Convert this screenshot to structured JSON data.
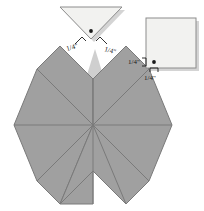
{
  "figure": {
    "background_color": "#ffffff",
    "colors": {
      "star_fill": "#a0a0a0",
      "star_stroke": "#7a7a7a",
      "piece_fill": "#f2f2f0",
      "piece_stroke": "#8c8c8c",
      "mark_color": "#1a1a1a",
      "shadow_color": "#c8c8c8"
    }
  },
  "star": {
    "name": "eight-pointed-star",
    "point_count": 8,
    "visible_diamond_count": 7,
    "missing_diamond": "top",
    "center": {
      "x": 93,
      "y": 125
    },
    "outer_radius": 79,
    "tips": {
      "left": {
        "x": 14,
        "y": 125
      },
      "right": {
        "x": 172,
        "y": 125
      },
      "bottom": {
        "x": 93,
        "y": 204
      },
      "top": {
        "x": 93,
        "y": 46
      }
    }
  },
  "triangle_piece": {
    "name": "setting-triangle",
    "orientation": "point-down",
    "vertices": [
      {
        "x": 60,
        "y": 7
      },
      {
        "x": 122,
        "y": 7
      },
      {
        "x": 91,
        "y": 39
      }
    ],
    "seam_dot": {
      "x": 91,
      "y": 31
    }
  },
  "square_piece": {
    "name": "corner-square",
    "x": 146,
    "y": 18,
    "width": 50,
    "height": 50,
    "seam_dot": {
      "x": 154,
      "y": 62
    }
  },
  "labels": {
    "triangle_left": "1/4\"",
    "triangle_right": "1/4\"",
    "square_left": "1/4\"",
    "square_bottom": "1/4\"",
    "fraction_numerator": "1",
    "fraction_denominator": "4",
    "inch_symbol": "\""
  }
}
